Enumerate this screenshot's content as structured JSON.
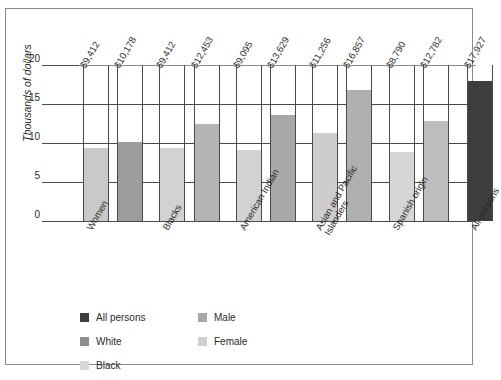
{
  "chart_data": {
    "type": "bar",
    "title": "",
    "xlabel": "",
    "ylabel": "Thousands of dollars",
    "ylim": [
      0,
      20
    ],
    "yticks": [
      "0",
      "5",
      "10",
      "15",
      "20"
    ],
    "grid": true,
    "legend_position": "bottom-left",
    "categories": [
      "Women",
      "Blacks",
      "American Indian",
      "Asian and Pacific Islanders",
      "Spanish origin",
      "All persons"
    ],
    "legend": [
      {
        "label": "All persons",
        "color": "#3d3d3d"
      },
      {
        "label": "White",
        "color": "#8f8f8f"
      },
      {
        "label": "Black",
        "color": "#d8d8d8"
      },
      {
        "label": "Male",
        "color": "#a8a8a8"
      },
      {
        "label": "Female",
        "color": "#cfcfcf"
      }
    ],
    "bars": [
      {
        "group": "Women",
        "series": "Female",
        "label": "$9,412",
        "value": 9.412,
        "color": "#c9c9c9"
      },
      {
        "group": "Women",
        "series": "Male",
        "label": "$10,178",
        "value": 10.178,
        "color": "#9c9c9c"
      },
      {
        "group": "Blacks",
        "series": "Female",
        "label": "$9,412",
        "value": 9.412,
        "color": "#d2d2d2"
      },
      {
        "group": "Blacks",
        "series": "Male",
        "label": "$12,453",
        "value": 12.453,
        "color": "#b4b4b4"
      },
      {
        "group": "American Indian",
        "series": "Female",
        "label": "$9,095",
        "value": 9.095,
        "color": "#d2d2d2"
      },
      {
        "group": "American Indian",
        "series": "Male",
        "label": "$13,629",
        "value": 13.629,
        "color": "#a8a8a8"
      },
      {
        "group": "Asian and Pacific Islanders",
        "series": "Female",
        "label": "$11,256",
        "value": 11.256,
        "color": "#cdcdcd"
      },
      {
        "group": "Asian and Pacific Islanders",
        "series": "Male",
        "label": "$16,857",
        "value": 16.857,
        "color": "#b0b0b0"
      },
      {
        "group": "Spanish origin",
        "series": "Female",
        "label": "$8,790",
        "value": 8.79,
        "color": "#d6d6d6"
      },
      {
        "group": "Spanish origin",
        "series": "Male",
        "label": "$12,782",
        "value": 12.782,
        "color": "#bdbdbd"
      },
      {
        "group": "All persons",
        "series": "All persons",
        "label": "$17,927",
        "value": 17.927,
        "color": "#3d3d3d"
      }
    ]
  }
}
